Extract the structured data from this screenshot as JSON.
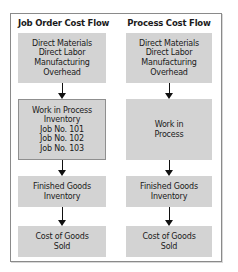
{
  "diagram": {
    "columns": [
      {
        "title": "Job Order Cost Flow",
        "boxes": [
          {
            "lines": [
              "Direct Materials",
              "Direct Labor",
              "Manufacturing",
              "Overhead"
            ]
          },
          {
            "lines": [
              "Work in Process",
              "Inventory",
              "Job No. 101",
              "Job No. 102",
              "Job No. 103"
            ]
          },
          {
            "lines": [
              "Finished Goods",
              "Inventory"
            ]
          },
          {
            "lines": [
              "Cost of Goods",
              "Sold"
            ]
          }
        ]
      },
      {
        "title": "Process Cost Flow",
        "boxes": [
          {
            "lines": [
              "Direct Materials",
              "Direct Labor",
              "Manufacturing",
              "Overhead"
            ]
          },
          {
            "lines": [
              "Work in",
              "Process"
            ]
          },
          {
            "lines": [
              "Finished Goods",
              "Inventory"
            ]
          },
          {
            "lines": [
              "Cost of Goods",
              "Sold"
            ]
          }
        ]
      }
    ],
    "colors": {
      "box_fill": "#d3d3d3",
      "frame_border": "#8a8a8a",
      "arrow": "#111111"
    }
  }
}
